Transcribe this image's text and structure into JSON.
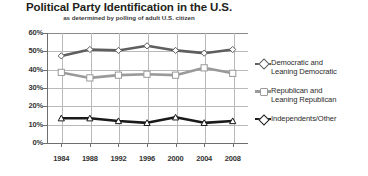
{
  "chart_data": {
    "type": "line",
    "title": "Political Party Identification in the U.S.",
    "subtitle": "as determined by polling of adult U.S. citizen",
    "xlabel": "",
    "ylabel": "",
    "x": [
      1984,
      1988,
      1992,
      1996,
      2000,
      2004,
      2008
    ],
    "categories": [
      "1984",
      "1988",
      "1992",
      "1996",
      "2000",
      "2004",
      "2008"
    ],
    "ylim": [
      0,
      60
    ],
    "yticks": [
      0,
      10,
      20,
      30,
      40,
      50,
      60
    ],
    "ytick_labels": [
      "0%",
      "10%",
      "20%",
      "30%",
      "40%",
      "50%",
      "60%"
    ],
    "grid": true,
    "legend_position": "right",
    "series": [
      {
        "name": "Democratic and Leaning Democratic",
        "legend_line1": "Democratic and",
        "legend_line2": "Leaning Democratic",
        "color": "#5e5e5e",
        "marker": "diamond",
        "values": [
          47.5,
          51,
          50.5,
          53,
          50.5,
          49,
          51
        ]
      },
      {
        "name": "Republican and Leaning Republican",
        "legend_line1": "Republican and",
        "legend_line2": "Leaning Republican",
        "color": "#9a9a9a",
        "marker": "square",
        "values": [
          38.5,
          35.5,
          37,
          37.5,
          37,
          41,
          38
        ]
      },
      {
        "name": "Independents/Other",
        "legend_line1": "Independents/Other",
        "legend_line2": "",
        "color": "#1a1a1a",
        "marker": "triangle",
        "values": [
          13.5,
          13.5,
          12,
          11,
          14,
          11,
          12
        ]
      }
    ]
  }
}
